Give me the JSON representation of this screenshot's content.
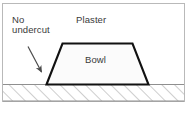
{
  "figure": {
    "type": "technical-cross-section-diagram",
    "background_color": "#ffffff",
    "frame": {
      "border_color": "#b9b9b9",
      "x": 2,
      "y": 3,
      "width": 183,
      "height": 99
    },
    "labels": {
      "no_undercut_line1": "No",
      "no_undercut_line2": "undercut",
      "plaster": "Plaster",
      "bowl": "Bowl"
    },
    "caption": "",
    "annotation": {
      "arrow_name": "leader-arrow",
      "arrow_color": "#4a4a4a",
      "points_from": "undercut",
      "points_to": "bowl-left-wall"
    },
    "shapes": {
      "bowl": {
        "name": "bowl-trapezoid",
        "outline_color": "#111111",
        "fill_color": "#fbfbfb",
        "top_left_x": 62,
        "top_right_x": 133,
        "top_y": 43,
        "bottom_left_x": 46,
        "bottom_right_x": 148,
        "bottom_y": 84
      },
      "ground": {
        "name": "hatched-ground-band",
        "hatch_color": "#a9a9a9",
        "line_color": "#8f8f8f",
        "top_y": 84,
        "bottom_y": 101
      }
    }
  }
}
